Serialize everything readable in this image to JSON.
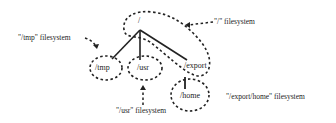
{
  "diagram": {
    "nodes": {
      "root": "/",
      "tmp": "/tmp",
      "usr": "/usr",
      "export": "/export",
      "home": "/home"
    },
    "labels": {
      "root_fs": "\"/\" filesystem",
      "tmp_fs": "\"/tmp\" filesystem",
      "usr_fs": "\"/usr\" filesystem",
      "home_fs": "\"/export/home\" filesystem"
    },
    "edges": [
      [
        "/",
        "/tmp"
      ],
      [
        "/",
        "/usr"
      ],
      [
        "/",
        "/export"
      ],
      [
        "/export",
        "/home"
      ]
    ],
    "colors": {
      "line": "#222222",
      "background": "#ffffff"
    }
  }
}
